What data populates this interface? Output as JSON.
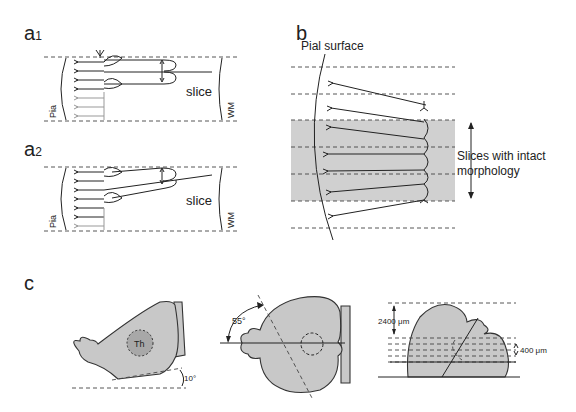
{
  "figure": {
    "panels": {
      "a1": {
        "label": "a",
        "sub": "1",
        "slice_label": "slice",
        "left_label": "Pia",
        "right_label": "WM"
      },
      "a2": {
        "label": "a",
        "sub": "2",
        "slice_label": "slice",
        "left_label": "Pia",
        "right_label": "WM"
      },
      "b": {
        "label": "b",
        "pial_label": "Pial surface",
        "slices_label_line1": "Slices with intact",
        "slices_label_line2": "morphology"
      },
      "c": {
        "label": "c",
        "thalamus_label": "Th",
        "angle_sagittal": "10°",
        "angle_horizontal": "55°",
        "depth_label": "2400 μm",
        "thickness_label": "400 μm"
      }
    },
    "colors": {
      "shade": "#d0d0d0",
      "brain_fill": "#c8c8c8",
      "thalamus_fill": "#a8a8a8",
      "ink": "#222222",
      "faint_neuron": "#999999"
    }
  }
}
